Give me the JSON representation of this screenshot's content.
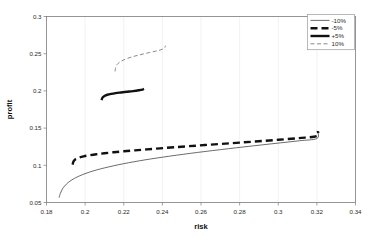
{
  "chart_data": {
    "type": "line",
    "title": "",
    "xlabel": "risk",
    "ylabel": "profit",
    "xlim": [
      0.18,
      0.34
    ],
    "ylim": [
      0.05,
      0.3
    ],
    "xticks": [
      0.18,
      0.2,
      0.22,
      0.24,
      0.26,
      0.28,
      0.3,
      0.32,
      0.34
    ],
    "yticks": [
      0.05,
      0.1,
      0.15,
      0.2,
      0.25,
      0.3
    ],
    "xtick_labels": [
      "0.18",
      "0.2",
      "0.22",
      "0.24",
      "0.26",
      "0.28",
      "0.3",
      "0.32",
      "0.34"
    ],
    "ytick_labels": [
      "0.05",
      "0.1",
      "0.15",
      "0.2",
      "0.25",
      "0.3"
    ],
    "grid": "vertical-only",
    "legend_position": "top-right",
    "background": "#ffffff",
    "axis_color": "#7a7a7a",
    "series": [
      {
        "name": "-10%",
        "style": "thin-solid",
        "color": "#3a3a3a",
        "width": 0.75,
        "dash": "none",
        "points": [
          [
            0.1865,
            0.0565
          ],
          [
            0.1872,
            0.0625
          ],
          [
            0.1882,
            0.068
          ],
          [
            0.1895,
            0.0725
          ],
          [
            0.1912,
            0.0768
          ],
          [
            0.1932,
            0.0805
          ],
          [
            0.1958,
            0.0842
          ],
          [
            0.1988,
            0.0876
          ],
          [
            0.2022,
            0.0908
          ],
          [
            0.206,
            0.0938
          ],
          [
            0.2102,
            0.0966
          ],
          [
            0.2148,
            0.0994
          ],
          [
            0.2198,
            0.1021
          ],
          [
            0.2252,
            0.1047
          ],
          [
            0.231,
            0.1073
          ],
          [
            0.2372,
            0.1098
          ],
          [
            0.2438,
            0.1123
          ],
          [
            0.2508,
            0.1148
          ],
          [
            0.2582,
            0.1173
          ],
          [
            0.266,
            0.1198
          ],
          [
            0.2742,
            0.1223
          ],
          [
            0.2828,
            0.1249
          ],
          [
            0.2918,
            0.1275
          ],
          [
            0.3012,
            0.1302
          ],
          [
            0.311,
            0.133
          ],
          [
            0.32,
            0.136
          ],
          [
            0.3205,
            0.1452
          ]
        ]
      },
      {
        "name": "-5%",
        "style": "thick-dashed",
        "color": "#111111",
        "width": 2.4,
        "dash": "7,4",
        "points": [
          [
            0.1935,
            0.1008
          ],
          [
            0.194,
            0.1052
          ],
          [
            0.195,
            0.1082
          ],
          [
            0.1968,
            0.1103
          ],
          [
            0.1992,
            0.112
          ],
          [
            0.2022,
            0.1135
          ],
          [
            0.2058,
            0.1149
          ],
          [
            0.21,
            0.1162
          ],
          [
            0.2148,
            0.1175
          ],
          [
            0.22,
            0.1188
          ],
          [
            0.2258,
            0.1201
          ],
          [
            0.232,
            0.1214
          ],
          [
            0.2388,
            0.1228
          ],
          [
            0.246,
            0.1242
          ],
          [
            0.2538,
            0.1257
          ],
          [
            0.262,
            0.1272
          ],
          [
            0.2708,
            0.1288
          ],
          [
            0.28,
            0.1305
          ],
          [
            0.2898,
            0.1323
          ],
          [
            0.3,
            0.1343
          ],
          [
            0.3108,
            0.1366
          ],
          [
            0.32,
            0.1392
          ],
          [
            0.3205,
            0.1462
          ]
        ]
      },
      {
        "name": "+5%",
        "style": "thick-solid",
        "color": "#111111",
        "width": 2.4,
        "dash": "none",
        "points": [
          [
            0.2085,
            0.1875
          ],
          [
            0.209,
            0.191
          ],
          [
            0.21,
            0.1932
          ],
          [
            0.2115,
            0.1948
          ],
          [
            0.2135,
            0.196
          ],
          [
            0.2158,
            0.197
          ],
          [
            0.2185,
            0.1979
          ],
          [
            0.2215,
            0.1988
          ],
          [
            0.2248,
            0.1997
          ],
          [
            0.2278,
            0.2008
          ],
          [
            0.2298,
            0.2018
          ],
          [
            0.2305,
            0.2026
          ]
        ]
      },
      {
        "name": "10%",
        "style": "thin-dashed",
        "color": "#6a6a6a",
        "width": 0.8,
        "dash": "4,2.5",
        "points": [
          [
            0.2155,
            0.2262
          ],
          [
            0.2158,
            0.2312
          ],
          [
            0.2165,
            0.2352
          ],
          [
            0.2178,
            0.2385
          ],
          [
            0.2196,
            0.2412
          ],
          [
            0.2218,
            0.2436
          ],
          [
            0.2244,
            0.2458
          ],
          [
            0.2272,
            0.2478
          ],
          [
            0.2302,
            0.2497
          ],
          [
            0.2334,
            0.2516
          ],
          [
            0.2366,
            0.2535
          ],
          [
            0.2392,
            0.2552
          ],
          [
            0.2412,
            0.2581
          ],
          [
            0.2415,
            0.2608
          ]
        ]
      }
    ],
    "legend_entries": [
      {
        "label": "-10%",
        "style": "thin-solid"
      },
      {
        "label": "-5%",
        "style": "thick-dashed"
      },
      {
        "label": "+5%",
        "style": "thick-solid"
      },
      {
        "label": "10%",
        "style": "thin-dashed"
      }
    ]
  }
}
